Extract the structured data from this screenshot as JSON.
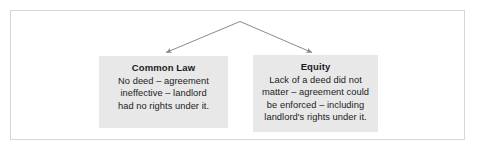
{
  "diagram": {
    "type": "split-branch",
    "frame": {
      "visible": true,
      "border_color": "#d6d6d6"
    },
    "connector": {
      "name": "inverted-v-arrows",
      "apex": {
        "x": 240,
        "y": 21
      },
      "color": "#8a8a8a",
      "arrow_count": 2,
      "left_arrow_tip": {
        "x": 165,
        "y": 53
      },
      "right_arrow_tip": {
        "x": 313,
        "y": 53
      }
    },
    "boxes": [
      {
        "id": "common-law",
        "title": "Common Law",
        "background": "#e8e8e8",
        "text_color": "#1b1b1b",
        "lines": [
          "No deed – agreement",
          "ineffective – landlord",
          "had no rights under it."
        ]
      },
      {
        "id": "equity",
        "title": "Equity",
        "background": "#e8e8e8",
        "text_color": "#1b1b1b",
        "lines": [
          "Lack of a deed did not",
          "matter – agreement could",
          "be enforced – including",
          "landlord's rights under it."
        ]
      }
    ]
  }
}
